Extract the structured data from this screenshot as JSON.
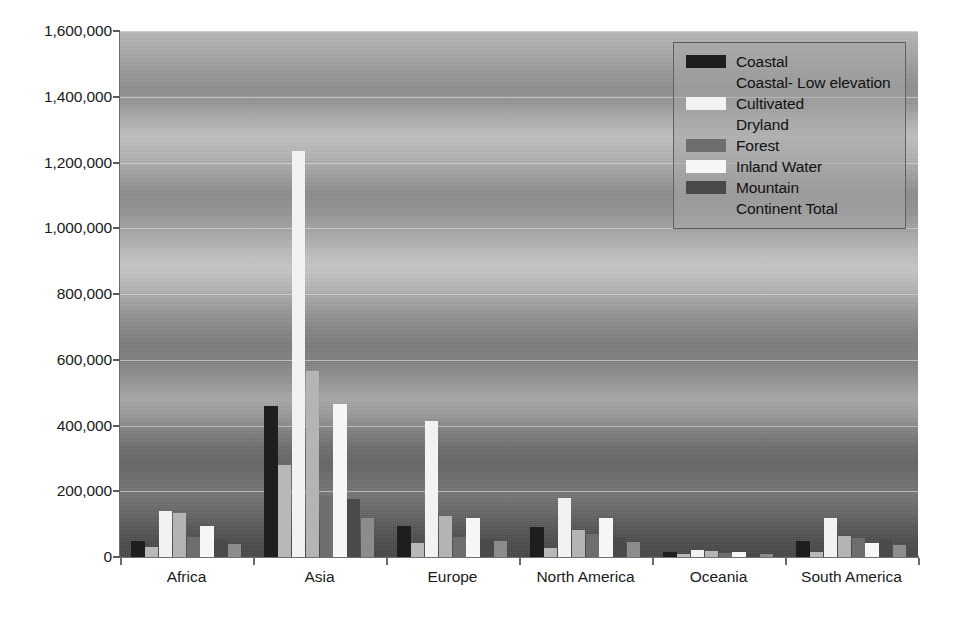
{
  "chart_data": {
    "type": "bar",
    "title": "",
    "xlabel": "",
    "ylabel": "",
    "ylim": [
      0,
      1600000
    ],
    "ytick_values": [
      0,
      200000,
      400000,
      600000,
      800000,
      1000000,
      1200000,
      1400000,
      1600000
    ],
    "ytick_labels": [
      "0",
      "200,000",
      "400,000",
      "600,000",
      "800,000",
      "1,000,000",
      "1,200,000",
      "1,400,000",
      "1,600,000"
    ],
    "grid": true,
    "legend_position": "top-right",
    "categories": [
      "Africa",
      "Asia",
      "Europe",
      "North America",
      "Oceania",
      "South America"
    ],
    "series": [
      {
        "name": "Coastal",
        "color": "#1e1e1e",
        "values": [
          48000,
          460000,
          95000,
          90000,
          14000,
          48000
        ]
      },
      {
        "name": "Coastal- Low elevation",
        "color": "#b8b8b8",
        "values": [
          30000,
          280000,
          42000,
          28000,
          9000,
          15000
        ]
      },
      {
        "name": "Cultivated",
        "color": "#f2f2f0",
        "values": [
          140000,
          1235000,
          415000,
          180000,
          20000,
          120000
        ]
      },
      {
        "name": "Dryland",
        "color": "#b4b4b4",
        "values": [
          135000,
          565000,
          125000,
          82000,
          17000,
          65000
        ]
      },
      {
        "name": "Forest",
        "color": "#6e6e6e",
        "values": [
          60000,
          185000,
          60000,
          70000,
          12000,
          58000
        ]
      },
      {
        "name": "Inland Water",
        "color": "#f6f6f4",
        "values": [
          95000,
          465000,
          120000,
          118000,
          15000,
          42000
        ]
      },
      {
        "name": "Mountain",
        "color": "#4a4a4a",
        "values": [
          55000,
          175000,
          55000,
          60000,
          11000,
          52000
        ]
      },
      {
        "name": "Continent Total",
        "color": "#8c8c8c",
        "values": [
          40000,
          120000,
          48000,
          45000,
          10000,
          38000
        ]
      }
    ]
  },
  "legend": {
    "items": [
      {
        "label": "Coastal",
        "swatch": "#1e1e1e",
        "has_swatch": true
      },
      {
        "label": "Coastal- Low elevation",
        "swatch": "#b8b8b8",
        "has_swatch": false
      },
      {
        "label": "Cultivated",
        "swatch": "#f2f2f0",
        "has_swatch": true
      },
      {
        "label": "Dryland",
        "swatch": "#b4b4b4",
        "has_swatch": false
      },
      {
        "label": "Forest",
        "swatch": "#6e6e6e",
        "has_swatch": true
      },
      {
        "label": "Inland Water",
        "swatch": "#f6f6f4",
        "has_swatch": true
      },
      {
        "label": "Mountain",
        "swatch": "#4a4a4a",
        "has_swatch": true
      },
      {
        "label": "Continent Total",
        "swatch": "#8c8c8c",
        "has_swatch": false
      }
    ]
  }
}
